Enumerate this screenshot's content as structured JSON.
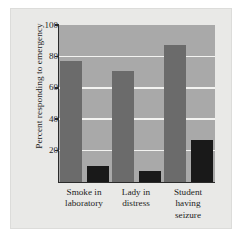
{
  "chart_data": {
    "type": "bar",
    "title": "",
    "xlabel": "",
    "ylabel": "Percent responding to emergency",
    "ylim": [
      0,
      100
    ],
    "yticks": [
      0,
      20,
      40,
      60,
      80,
      100
    ],
    "ytick_labels": [
      "",
      "20",
      "40",
      "60",
      "80",
      "100"
    ],
    "grid": true,
    "legend": "none",
    "categories": [
      "Smoke in laboratory",
      "Lady in distress",
      "Student having seizure"
    ],
    "category_lines": [
      [
        "Smoke in",
        "laboratory"
      ],
      [
        "Lady in",
        "distress"
      ],
      [
        "Student",
        "having",
        "seizure"
      ]
    ],
    "series": [
      {
        "name": "Alone",
        "color": "#6b6b6b",
        "values": [
          77,
          71,
          87
        ]
      },
      {
        "name": "With others",
        "color": "#191919",
        "values": [
          10,
          7,
          27
        ]
      }
    ]
  },
  "figure": {
    "background": "#e9e9e7",
    "plot_background": "#a9a9a9",
    "gridline_color": "#f3f3f1",
    "axis_color": "#2b2b2b"
  }
}
